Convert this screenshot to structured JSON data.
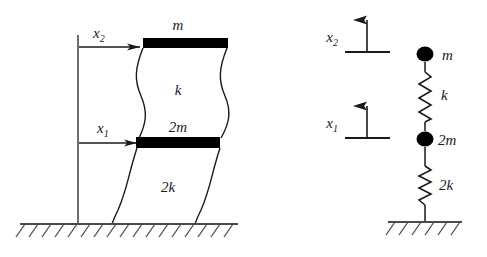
{
  "figure": {
    "domain": "Diagram",
    "background_color": "#ffffff",
    "ink_color": "#1a1a1a",
    "fill_color": "#000000"
  },
  "left_diagram": {
    "name": "shear-frame-diagram",
    "labels": {
      "x2": {
        "base": "x",
        "sub": "2"
      },
      "x1": {
        "base": "x",
        "sub": "1"
      },
      "top_mass": "m",
      "lower_mass": "2m",
      "upper_stiffness": "k",
      "lower_stiffness": "2k"
    },
    "reference_line": {
      "x": 78,
      "y_top": 35,
      "y_bottom": 224
    },
    "arrows": [
      {
        "name": "x2-displacement-arrow",
        "y": 47,
        "x_start": 79,
        "x_end": 143
      },
      {
        "name": "x1-displacement-arrow",
        "y": 143,
        "x_start": 79,
        "x_end": 140
      }
    ],
    "floor_slabs": [
      {
        "name": "top-floor-slab",
        "label": "m",
        "x": 143,
        "y": 38,
        "width": 85,
        "height": 10
      },
      {
        "name": "lower-floor-slab",
        "label": "2m",
        "x": 136,
        "y": 137,
        "width": 84,
        "height": 11
      }
    ],
    "ground": {
      "y": 224,
      "x_start": 20,
      "x_end": 238,
      "hatch_count": 17
    }
  },
  "right_diagram": {
    "name": "lumped-mass-spring-model",
    "labels": {
      "x2": {
        "base": "x",
        "sub": "2"
      },
      "x1": {
        "base": "x",
        "sub": "1"
      },
      "top_mass": "m",
      "lower_mass": "2m",
      "upper_spring": "k",
      "lower_spring": "2k"
    },
    "arrows": [
      {
        "name": "x2-direction-arrow",
        "x": 367,
        "y_tail": 52,
        "y_head": 17,
        "base_x_start": 345,
        "base_x_end": 390
      },
      {
        "name": "x1-direction-arrow",
        "x": 367,
        "y_tail": 138,
        "y_head": 103,
        "base_x_start": 345,
        "base_x_end": 390
      }
    ],
    "masses": [
      {
        "name": "mass-node-m",
        "label": "m",
        "cx": 425,
        "cy": 54,
        "r": 8
      },
      {
        "name": "mass-node-2m",
        "label": "2m",
        "cx": 425,
        "cy": 139,
        "r": 8
      }
    ],
    "springs": [
      {
        "name": "spring-k",
        "label": "k",
        "x": 425,
        "y_start": 63,
        "y_end": 131,
        "coils": 5
      },
      {
        "name": "spring-2k",
        "label": "2k",
        "x": 425,
        "y_start": 165,
        "y_end": 205,
        "coils": 5
      }
    ],
    "ground": {
      "y": 222,
      "x_start": 388,
      "x_end": 462,
      "hatch_count": 6
    }
  }
}
